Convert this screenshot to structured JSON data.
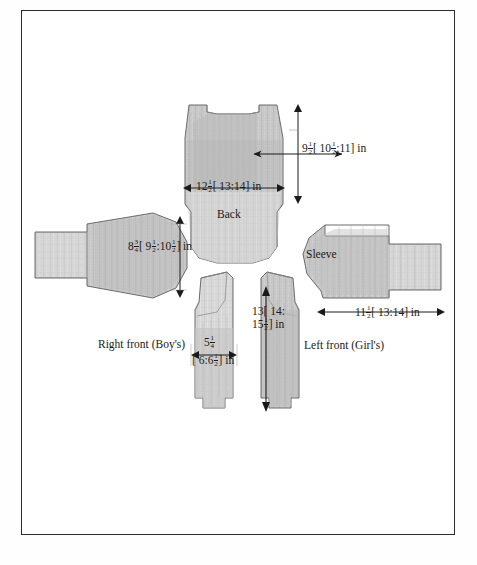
{
  "document": {
    "type": "sewing-pattern-cutting-layout",
    "title": "",
    "page_background": "#ffffff",
    "border_color": "#2b2b2b",
    "fabric_fill": "#c9c9c9",
    "outline_color": "#6e6e6e"
  },
  "pieces": [
    {
      "id": "back",
      "label": "Back"
    },
    {
      "id": "sleeve",
      "label": "Sleeve"
    },
    {
      "id": "right-front",
      "label": "Right front (Boy's)"
    },
    {
      "id": "left-front",
      "label": "Left front (Girl's)"
    }
  ],
  "dimensions": {
    "back_height": {
      "whole": "9",
      "num": "1",
      "den": "2",
      "bracket_pre": "[ 10",
      "bracket_num": "1",
      "bracket_den": "2",
      "bracket_post": ":11] in",
      "full_text": "9 1/2 [ 10 1/2 :11] in"
    },
    "back_width": {
      "whole": "12",
      "num": "1",
      "den": "2",
      "rest": "[ 13:14] in",
      "full_text": "12 1/2 [ 13:14] in"
    },
    "sleeve_height": {
      "whole": "8",
      "num": "3",
      "den": "4",
      "b1_pre": "[ 9",
      "b1_num": "1",
      "b1_den": "2",
      "b2_pre": ":10",
      "b2_num": "1",
      "b2_den": "2",
      "b_post": "] in",
      "full_text": "8 3/4 [ 9 1/2 :10 1/2 ] in"
    },
    "sleeve_width": {
      "whole": "11",
      "num": "1",
      "den": "2",
      "rest": "[ 13:14] in",
      "full_text": "11 1/2 [ 13:14] in"
    },
    "front_length_line1": "13[ 14:",
    "front_length_line2_whole": "15",
    "front_length_line2_num": "1",
    "front_length_line2_den": "2",
    "front_length_line2_rest": "] in",
    "front_length_full": "13 [ 14: 15 1/2 ] in",
    "front_width_top_whole": "5",
    "front_width_top_num": "1",
    "front_width_top_den": "4",
    "front_width_bottom_pre": "[ 6:6",
    "front_width_bottom_num": "1",
    "front_width_bottom_den": "2",
    "front_width_bottom_post": "] in",
    "front_width_full": "5 1/4 [ 6:6 1/2 ] in"
  }
}
